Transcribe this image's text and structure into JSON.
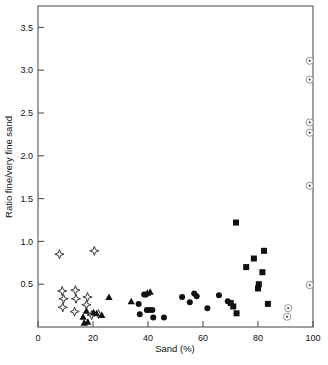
{
  "chart_data": {
    "type": "scatter",
    "title": "",
    "xlabel": "Sand (%)",
    "ylabel": "Ratio fine/very fine sand",
    "xlim": [
      0,
      100
    ],
    "ylim": [
      0,
      3.75
    ],
    "xticks": [
      0,
      20,
      40,
      60,
      80,
      100
    ],
    "xtick_labels": [
      "0",
      "20",
      "40",
      "60",
      "80",
      "100"
    ],
    "yticks": [
      0.5,
      1.0,
      1.5,
      2.0,
      2.5,
      3.0,
      3.5
    ],
    "ytick_labels": [
      "0.5",
      "1.0",
      "1.5",
      "2.0",
      "2.5",
      "3.0",
      "3.5"
    ],
    "grid": false,
    "legend": "none",
    "series": [
      {
        "name": "open-star",
        "marker": "four-pointed-star-open",
        "points": [
          [
            7.8,
            0.85
          ],
          [
            20.5,
            0.89
          ],
          [
            8.8,
            0.42
          ],
          [
            9.3,
            0.33
          ],
          [
            9.0,
            0.23
          ],
          [
            13.6,
            0.43
          ],
          [
            13.8,
            0.33
          ],
          [
            13.3,
            0.18
          ],
          [
            18.0,
            0.35
          ],
          [
            17.6,
            0.26
          ],
          [
            19.5,
            0.14
          ],
          [
            22.0,
            0.15
          ]
        ]
      },
      {
        "name": "filled-triangle",
        "marker": "triangle-filled",
        "points": [
          [
            16.4,
            0.12
          ],
          [
            16.8,
            0.05
          ],
          [
            17.6,
            0.19
          ],
          [
            18.1,
            0.06
          ],
          [
            20.2,
            0.17
          ],
          [
            21.3,
            0.16
          ],
          [
            23.2,
            0.14
          ],
          [
            25.8,
            0.35
          ],
          [
            33.9,
            0.3
          ],
          [
            39.8,
            0.4
          ],
          [
            40.8,
            0.41
          ]
        ]
      },
      {
        "name": "filled-circle",
        "marker": "circle-filled",
        "points": [
          [
            36.6,
            0.27
          ],
          [
            37.0,
            0.15
          ],
          [
            38.6,
            0.38
          ],
          [
            39.3,
            0.38
          ],
          [
            39.6,
            0.2
          ],
          [
            40.5,
            0.2
          ],
          [
            41.6,
            0.2
          ],
          [
            41.9,
            0.11
          ],
          [
            45.8,
            0.11
          ],
          [
            52.4,
            0.35
          ],
          [
            55.2,
            0.29
          ],
          [
            56.8,
            0.39
          ],
          [
            57.7,
            0.36
          ],
          [
            61.6,
            0.22
          ],
          [
            65.8,
            0.37
          ],
          [
            69.0,
            0.3
          ]
        ]
      },
      {
        "name": "filled-square",
        "marker": "square-filled",
        "points": [
          [
            72.0,
            1.22
          ],
          [
            70.1,
            0.28
          ],
          [
            71.0,
            0.24
          ],
          [
            72.2,
            0.16
          ],
          [
            75.7,
            0.7
          ],
          [
            78.5,
            0.8
          ],
          [
            80.0,
            0.45
          ],
          [
            80.3,
            0.5
          ],
          [
            81.6,
            0.64
          ],
          [
            82.2,
            0.89
          ],
          [
            83.6,
            0.27
          ]
        ]
      },
      {
        "name": "bullseye",
        "marker": "circle-with-center-dot",
        "points": [
          [
            98.8,
            3.11
          ],
          [
            98.8,
            2.89
          ],
          [
            98.8,
            2.39
          ],
          [
            98.8,
            2.27
          ],
          [
            98.8,
            1.65
          ],
          [
            98.8,
            0.49
          ],
          [
            91.0,
            0.22
          ],
          [
            90.6,
            0.12
          ]
        ]
      }
    ]
  }
}
